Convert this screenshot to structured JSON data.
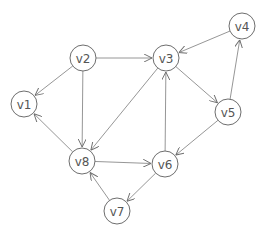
{
  "diagram": {
    "type": "directed-graph",
    "node_radius": 13,
    "colors": {
      "node_stroke": "#6e6e6e",
      "edge": "#8a8a8a",
      "label": "#555555",
      "background": "#ffffff"
    },
    "nodes": [
      {
        "id": "v1",
        "label": "v1",
        "x": 24,
        "y": 104
      },
      {
        "id": "v2",
        "label": "v2",
        "x": 83,
        "y": 58
      },
      {
        "id": "v3",
        "label": "v3",
        "x": 166,
        "y": 58
      },
      {
        "id": "v4",
        "label": "v4",
        "x": 242,
        "y": 26
      },
      {
        "id": "v5",
        "label": "v5",
        "x": 228,
        "y": 112
      },
      {
        "id": "v6",
        "label": "v6",
        "x": 165,
        "y": 164
      },
      {
        "id": "v7",
        "label": "v7",
        "x": 117,
        "y": 211
      },
      {
        "id": "v8",
        "label": "v8",
        "x": 82,
        "y": 161
      }
    ],
    "edges": [
      {
        "from": "v2",
        "to": "v3"
      },
      {
        "from": "v2",
        "to": "v1"
      },
      {
        "from": "v2",
        "to": "v8"
      },
      {
        "from": "v4",
        "to": "v3"
      },
      {
        "from": "v3",
        "to": "v5"
      },
      {
        "from": "v5",
        "to": "v4"
      },
      {
        "from": "v5",
        "to": "v6"
      },
      {
        "from": "v6",
        "to": "v3"
      },
      {
        "from": "v3",
        "to": "v8"
      },
      {
        "from": "v8",
        "to": "v1"
      },
      {
        "from": "v8",
        "to": "v6"
      },
      {
        "from": "v6",
        "to": "v7"
      },
      {
        "from": "v7",
        "to": "v8"
      }
    ]
  }
}
